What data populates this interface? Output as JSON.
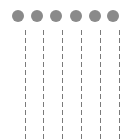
{
  "colors": {
    "dot": "#8a8a8a",
    "line": "#7a7a7a",
    "background": "#ffffff"
  },
  "dots": [
    {
      "icon": "grey-circle-icon",
      "x": 12
    },
    {
      "icon": "grey-circle-icon",
      "x": 31
    },
    {
      "icon": "grey-circle-icon",
      "x": 50
    },
    {
      "icon": "grey-circle-icon",
      "x": 70
    },
    {
      "icon": "grey-circle-icon",
      "x": 89
    },
    {
      "icon": "grey-circle-icon",
      "x": 107
    }
  ],
  "lines": [
    {
      "style": "dashed",
      "x": 25
    },
    {
      "style": "dashed",
      "x": 43
    },
    {
      "style": "dashed",
      "x": 62
    },
    {
      "style": "dashed",
      "x": 81
    },
    {
      "style": "dashed",
      "x": 100
    },
    {
      "style": "dashed",
      "x": 119
    }
  ]
}
